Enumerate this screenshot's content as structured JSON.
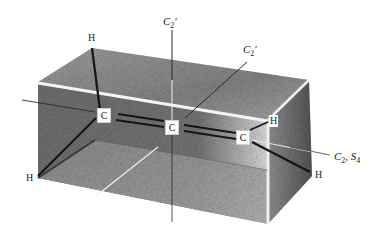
{
  "figure": {
    "colors": {
      "background": "#ffffff",
      "box_top": "#8a8a8a",
      "box_front": "#6e6e6e",
      "box_right": "#7a7a7a",
      "box_bottom": "#9a9a9a",
      "bond": "#1a1a1a",
      "axis": "#2a2a2a",
      "label": "#222222"
    }
  },
  "atoms": {
    "carbons": [
      {
        "id": "C-left",
        "label": "C"
      },
      {
        "id": "C-center",
        "label": "C"
      },
      {
        "id": "C-right",
        "label": "C"
      }
    ],
    "hydrogens": [
      {
        "id": "H-top-left",
        "label": "H"
      },
      {
        "id": "H-bottom-left",
        "label": "H"
      },
      {
        "id": "H-right-upper",
        "label": "H"
      },
      {
        "id": "H-right-lower",
        "label": "H"
      }
    ]
  },
  "axes": {
    "c2prime_vertical": {
      "symbol": "C",
      "sub": "2",
      "prime": "′"
    },
    "c2prime_diagonal": {
      "symbol": "C",
      "sub": "2",
      "prime": "′"
    },
    "principal": {
      "symbol1": "C",
      "sub1": "2",
      "sep": ", ",
      "symbol2": "S",
      "sub2": "4"
    }
  }
}
